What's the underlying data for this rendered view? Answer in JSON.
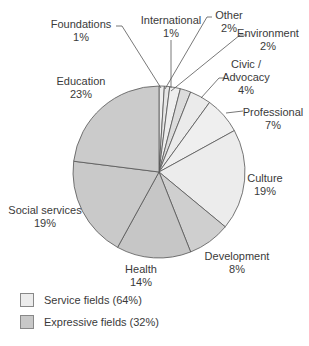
{
  "chart_data": {
    "type": "pie",
    "title": "",
    "start_angle_deg": 0,
    "direction": "clockwise",
    "slices": [
      {
        "label": "Foundations",
        "value": 1,
        "group": "service"
      },
      {
        "label": "International",
        "value": 1,
        "group": "service"
      },
      {
        "label": "Other",
        "value": 2,
        "group": "service"
      },
      {
        "label": "Environment",
        "value": 2,
        "group": "service"
      },
      {
        "label": "Civic / Advocacy",
        "value": 4,
        "group": "service"
      },
      {
        "label": "Professional",
        "value": 7,
        "group": "service"
      },
      {
        "label": "Culture",
        "value": 19,
        "group": "service"
      },
      {
        "label": "Development",
        "value": 8,
        "group": "expressive"
      },
      {
        "label": "Health",
        "value": 14,
        "group": "expressive"
      },
      {
        "label": "Social services",
        "value": 19,
        "group": "expressive"
      },
      {
        "label": "Education",
        "value": 23,
        "group": "expressive"
      }
    ],
    "legend": [
      {
        "label": "Service fields (64%)",
        "color": "#ececec"
      },
      {
        "label": "Expressive fields (32%)",
        "color": "#c8c8c8"
      }
    ]
  },
  "labels": [
    {
      "l1": "Foundations",
      "l2": "1%",
      "x": 81,
      "y": 18
    },
    {
      "l1": "International",
      "l2": "1%",
      "x": 171,
      "y": 14
    },
    {
      "l1": "Other",
      "l2": "2%",
      "x": 229,
      "y": 9
    },
    {
      "l1": "Environment",
      "l2": "2%",
      "x": 268,
      "y": 27
    },
    {
      "l1": "Civic /",
      "l2": "Advocacy",
      "l3": "4%",
      "x": 246,
      "y": 58
    },
    {
      "l1": "Professional",
      "l2": "7%",
      "x": 273,
      "y": 106
    },
    {
      "l1": "Culture",
      "l2": "19%",
      "x": 265,
      "y": 172
    },
    {
      "l1": "Development",
      "l2": "8%",
      "x": 237,
      "y": 250
    },
    {
      "l1": "Health",
      "l2": "14%",
      "x": 141,
      "y": 263
    },
    {
      "l1": "Social services",
      "l2": "19%",
      "x": 45,
      "y": 204
    },
    {
      "l1": "Education",
      "l2": "23%",
      "x": 81,
      "y": 75
    }
  ]
}
